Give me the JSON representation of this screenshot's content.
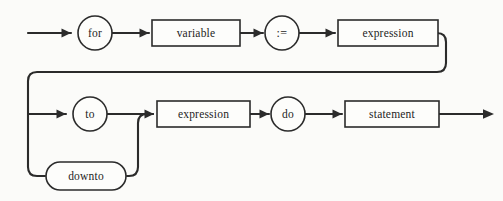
{
  "diagram": {
    "kind": "railroad-syntax-diagram",
    "colors": {
      "background": "#fbfbf9",
      "line": "#2b2b2b",
      "node_fill": "#fdfdfb",
      "text": "#1d1d1d"
    },
    "nodes": {
      "for": {
        "label": "for",
        "shape": "circle",
        "type": "terminal",
        "cx": 95,
        "cy": 33,
        "r": 17
      },
      "variable": {
        "label": "variable",
        "shape": "rect",
        "type": "nonterminal",
        "x": 152,
        "y": 20,
        "w": 88,
        "h": 26
      },
      "assign": {
        "label": ":=",
        "shape": "circle",
        "type": "terminal",
        "cx": 282,
        "cy": 33,
        "r": 17
      },
      "expression_upper": {
        "label": "expression",
        "shape": "rect",
        "type": "nonterminal",
        "x": 338,
        "y": 20,
        "w": 100,
        "h": 26
      },
      "to": {
        "label": "to",
        "shape": "circle",
        "type": "terminal",
        "cx": 90,
        "cy": 114,
        "r": 17
      },
      "downto": {
        "label": "downto",
        "shape": "stadium",
        "type": "terminal",
        "x": 46,
        "y": 162,
        "w": 80,
        "h": 28
      },
      "expression_lower": {
        "label": "expression",
        "shape": "rect",
        "type": "nonterminal",
        "x": 157,
        "y": 101,
        "w": 93,
        "h": 26
      },
      "do": {
        "label": "do",
        "shape": "circle",
        "type": "terminal",
        "cx": 288,
        "cy": 114,
        "r": 17
      },
      "statement": {
        "label": "statement",
        "shape": "rect",
        "type": "nonterminal",
        "x": 345,
        "y": 101,
        "w": 94,
        "h": 26
      }
    },
    "sequence_upper": [
      "for",
      "variable",
      ":=",
      "expression"
    ],
    "sequence_lower": [
      "to | downto",
      "expression",
      "do",
      "statement"
    ],
    "branch_alternatives": [
      "to",
      "downto"
    ],
    "entry_point": {
      "x": 28,
      "y": 33
    },
    "exit_point": {
      "x": 494,
      "y": 114
    }
  }
}
